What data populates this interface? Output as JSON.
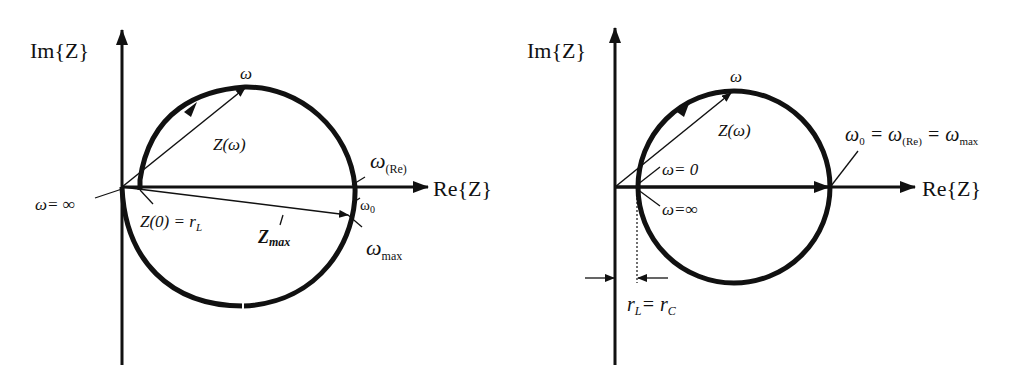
{
  "left_diagram": {
    "axis_y_label": "Im{Z}",
    "axis_x_label": "Re{Z}",
    "omega_top": "ω",
    "z_omega": "Z(ω)",
    "omega_re": "ω",
    "omega_re_sub": "(Re)",
    "omega_inf": "ω= ∞",
    "z0": "Z(0) = r",
    "z0_sub": "L",
    "omega0": "ω",
    "omega0_sub": "0",
    "zmax": "Z",
    "zmax_sub": "max",
    "omega_max": "ω",
    "omega_max_sub": "max"
  },
  "right_diagram": {
    "axis_y_label": "Im{Z}",
    "axis_x_label": "Re{Z}",
    "omega_top": "ω",
    "z_omega": "Z(ω)",
    "omega_zero": "ω= 0",
    "omega_inf": "ω=∞",
    "eq_w0": "ω",
    "eq_w0_sub": "0",
    "eq_eq1": " = ω",
    "eq_re_sub": "(Re)",
    "eq_eq2": " = ω",
    "eq_max_sub": "max",
    "rl": "r",
    "rl_sub": "L",
    "rc": "= r",
    "rc_sub": "C"
  },
  "colors": {
    "ink": "#111111",
    "background": "#ffffff"
  }
}
